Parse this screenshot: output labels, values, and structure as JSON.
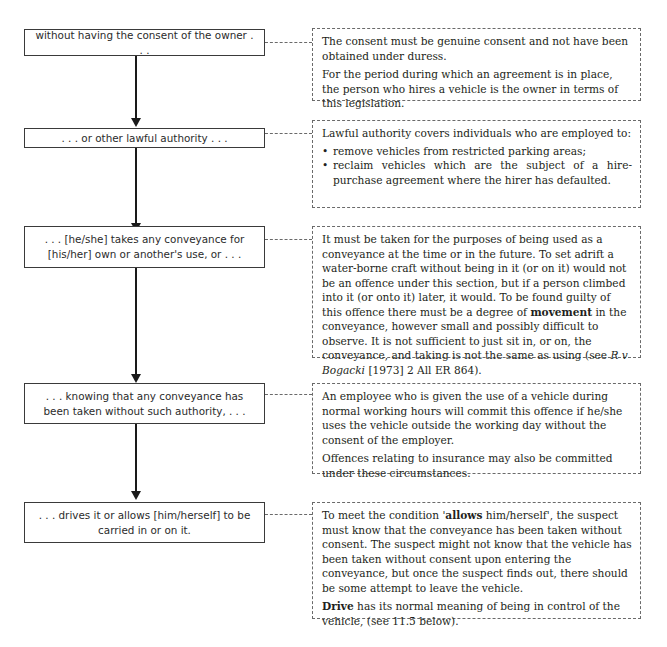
{
  "diagram": {
    "steps": [
      {
        "label": "without having the consent of the owner . . .",
        "note": {
          "paragraphs": [
            "The consent must be genuine consent and not have been obtained under duress.",
            "For the period during which an agreement is in place, the person who hires a vehicle is the owner in terms of this legislation."
          ]
        }
      },
      {
        "label": ". . . or other lawful authority . . .",
        "note": {
          "intro": "Lawful authority covers individuals who are employed to:",
          "bullets": [
            "remove vehicles from restricted parking areas;",
            "reclaim vehicles which are the subject of a hire-purchase agreement where the hirer has defaulted."
          ]
        }
      },
      {
        "label": ". . . [he/she] takes any conveyance for [his/her] own or another's use, or . . .",
        "note": {
          "text_before_bold": "It must be taken for the purposes of being used as a conveyance at the time or in the future. To set adrift a water-borne craft without being in it (or on it) would not be an offence under this section, but if a person climbed into it (or onto it) later, it would. To be found guilty of this offence there must be a degree of ",
          "bold": "movement",
          "text_after_bold": " in the conveyance, however small and possibly difficult to observe. It is not sufficient to just sit in, or on, the conveyance, and taking is not the same as using (see ",
          "case_italic": "R v Bogacki",
          "citation": " [1973] 2 All ER 864)."
        }
      },
      {
        "label": ". . . knowing that any conveyance has been taken without such authority, . . .",
        "note": {
          "paragraphs": [
            "An employee who is given the use of a vehicle during normal working hours will commit this offence if he/she uses the vehicle outside the working day without the consent of the employer.",
            "Offences relating to insurance may also be committed under these circumstances."
          ]
        }
      },
      {
        "label": ". . . drives it or allows [him/herself] to be carried in or on it.",
        "note": {
          "p1_before_bold": "To meet the condition '",
          "p1_bold": "allows",
          "p1_after_bold": " him/herself', the suspect must know that the conveyance has been taken without consent. The suspect might not know that the vehicle has been taken without consent upon entering the conveyance, but once the suspect finds out, there should be some attempt to leave the vehicle.",
          "p2_bold": "Drive",
          "p2_after_bold": " has its normal meaning of being in control of the vehicle, (see 11.5 below)."
        }
      }
    ]
  }
}
